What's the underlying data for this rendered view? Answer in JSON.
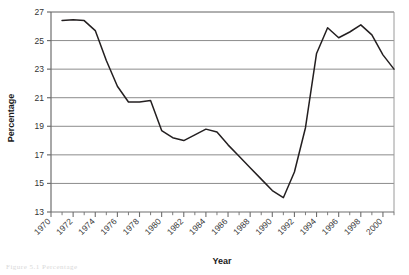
{
  "figure": {
    "caption_fragment": "Figure 5.1  Percentage"
  },
  "chart_data": {
    "type": "line",
    "title": "",
    "xlabel": "Year",
    "ylabel": "Percentage",
    "xlim": [
      1970,
      2001
    ],
    "ylim": [
      13,
      27
    ],
    "y_ticks": [
      13,
      15,
      17,
      19,
      21,
      23,
      25,
      27
    ],
    "x_ticks": [
      1970,
      1972,
      1974,
      1976,
      1978,
      1980,
      1982,
      1984,
      1986,
      1988,
      1990,
      1992,
      1994,
      1996,
      1998,
      2000
    ],
    "x_minor_tick_step": 1,
    "grid": "horizontal",
    "legend": "none",
    "line_color": "#231f20",
    "grid_color": "#8c8c8c",
    "axis_color": "#6e6e6e",
    "x_tick_label_rotation": -45,
    "x": [
      1971,
      1972,
      1973,
      1974,
      1975,
      1976,
      1977,
      1978,
      1979,
      1980,
      1981,
      1982,
      1983,
      1984,
      1985,
      1986,
      1987,
      1988,
      1989,
      1990,
      1991,
      1992,
      1993,
      1994,
      1995,
      1996,
      1997,
      1998,
      1999,
      2000,
      2001
    ],
    "values": [
      26.4,
      26.45,
      26.4,
      25.7,
      23.6,
      21.8,
      20.7,
      20.7,
      20.8,
      18.7,
      18.2,
      18.0,
      18.4,
      18.8,
      18.6,
      17.7,
      16.9,
      16.1,
      15.3,
      14.5,
      14.0,
      15.8,
      18.9,
      24.1,
      25.9,
      25.2,
      25.6,
      26.1,
      25.4,
      24.0,
      23.0
    ]
  }
}
